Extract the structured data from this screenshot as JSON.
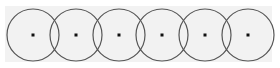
{
  "colors": {
    "page_background": "#ffffff",
    "panel_background": "#f2f2f2",
    "circle_stroke": "#555555",
    "dot_fill": "#111111"
  },
  "panel": {
    "x": 5,
    "y": 6,
    "width": 267,
    "height": 56
  },
  "circles": [
    {
      "cx": 33,
      "cy": 35,
      "r": 26
    },
    {
      "cx": 76,
      "cy": 35,
      "r": 26
    },
    {
      "cx": 119,
      "cy": 35,
      "r": 26
    },
    {
      "cx": 162,
      "cy": 35,
      "r": 26
    },
    {
      "cx": 205,
      "cy": 35,
      "r": 26
    },
    {
      "cx": 248,
      "cy": 35,
      "r": 26
    }
  ],
  "dot_size": 3
}
